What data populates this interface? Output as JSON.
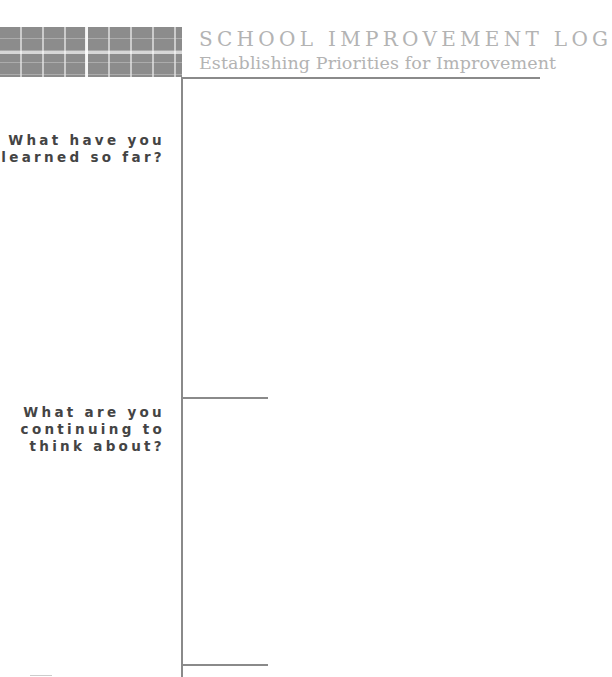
{
  "header": {
    "title": "SCHOOL IMPROVEMENT LOG",
    "subtitle": "Establishing Priorities for Improvement"
  },
  "prompts": [
    {
      "label": "What have you\nlearned so far?"
    },
    {
      "label": "What are you\ncontinuing to\nthink about?"
    }
  ],
  "colors": {
    "header_block": "#8c8c8c",
    "title_text": "#b3b3b3",
    "rules": "#8a8a8a",
    "prompt_text": "#444444"
  }
}
